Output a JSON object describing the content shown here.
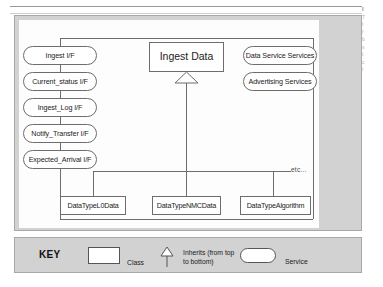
{
  "margin_text": {
    "lines": [
      "I",
      "T",
      "t",
      "f",
      "b",
      "s",
      "t",
      "c",
      "r"
    ]
  },
  "diagram": {
    "central_class": {
      "label": "Ingest Data"
    },
    "left_services": [
      {
        "label": "Ingest I/F"
      },
      {
        "label": "Current_status I/F"
      },
      {
        "label": "Ingest_Log I/F"
      },
      {
        "label": "Notify_Transfer I/F"
      },
      {
        "label": "Expected_Arrival I/F"
      }
    ],
    "right_services": [
      {
        "label": "Data Service Services"
      },
      {
        "label": "Advertising Services"
      }
    ],
    "subclasses": [
      {
        "label": "DataTypeL0Data"
      },
      {
        "label": "DataTypeNMCData"
      },
      {
        "label": "DataTypeAlgorithm"
      }
    ],
    "etc_label": "etc..."
  },
  "key": {
    "title": "KEY",
    "class_label": "Class",
    "inherits_label": "Inherits (from top to bottom)",
    "service_label": "Service"
  },
  "colors": {
    "panel_background": "#d2d2d2",
    "plate_background": "#fdfdfd",
    "stroke": "#6d6d6d",
    "text": "#1b1b1b"
  }
}
